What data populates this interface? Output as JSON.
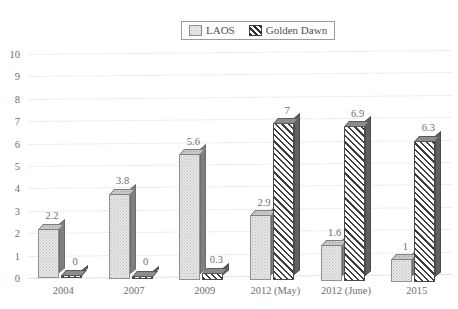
{
  "chart_data": {
    "type": "bar",
    "title": "",
    "subtitle": "",
    "xlabel": "",
    "ylabel": "",
    "ylim": [
      0,
      10
    ],
    "ytick_step": 1,
    "yticks": [
      "10",
      "9",
      "8",
      "7",
      "6",
      "5",
      "4",
      "3",
      "2",
      "1",
      "0"
    ],
    "grid": true,
    "legend_position": "top-center",
    "three_d": true,
    "categories": [
      "2004",
      "2007",
      "2009",
      "2012 (May)",
      "2012 (June)",
      "2015"
    ],
    "series": [
      {
        "name": "LAOS",
        "values": [
          2.2,
          3.8,
          5.6,
          2.9,
          1.6,
          1
        ],
        "labels": [
          "2.2",
          "3.8",
          "5.6",
          "2.9",
          "1.6",
          "1"
        ],
        "fill": "dotted-light-gray",
        "color": "#e6e7e8"
      },
      {
        "name": "Golden Dawn",
        "values": [
          0,
          0,
          0.3,
          7,
          6.9,
          6.3
        ],
        "labels": [
          "0",
          "0",
          "0.3",
          "7",
          "6.9",
          "6.3"
        ],
        "fill": "diagonal-hatch",
        "color": "#3d3d3f"
      }
    ]
  },
  "legend": {
    "items": [
      {
        "label": "LAOS",
        "swatch": "dotted-swatch-icon"
      },
      {
        "label": "Golden Dawn",
        "swatch": "hatched-swatch-icon"
      }
    ]
  },
  "colors": {
    "gridline": "#ededee",
    "axis_text": "#6c6d70",
    "legend_border": "#9a9b9d",
    "bar_side_face": "#6f7173",
    "background": "#ffffff"
  }
}
